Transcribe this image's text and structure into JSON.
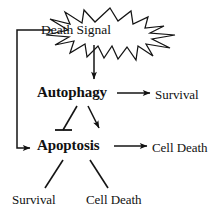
{
  "diagram": {
    "background_color": "#ffffff",
    "stroke_color": "#111111",
    "nodes": {
      "death_signal": {
        "label": "Death Signal",
        "shape": "starburst",
        "style": "plain"
      },
      "autophagy": {
        "label": "Autophagy",
        "shape": "text",
        "style": "bold"
      },
      "apoptosis": {
        "label": "Apoptosis",
        "shape": "text",
        "style": "bold"
      },
      "survival_from_autophagy": {
        "label": "Survival",
        "shape": "text",
        "style": "plain"
      },
      "cell_death_from_apoptosis": {
        "label": "Cell Death",
        "shape": "text",
        "style": "plain"
      },
      "survival_outcome": {
        "label": "Survival",
        "shape": "text",
        "style": "plain"
      },
      "cell_death_outcome": {
        "label": "Cell Death",
        "shape": "text",
        "style": "plain"
      }
    },
    "edges": [
      {
        "name": "death-signal-to-autophagy",
        "from": "death_signal",
        "to": "autophagy",
        "type": "activation",
        "head": "arrow",
        "orientation": "vertical-down"
      },
      {
        "name": "death-signal-to-apoptosis-feedback",
        "from": "death_signal",
        "to": "apoptosis",
        "type": "activation",
        "head": "arrow",
        "orientation": "bracket-left"
      },
      {
        "name": "autophagy-to-survival",
        "from": "autophagy",
        "to": "survival_from_autophagy",
        "type": "activation",
        "head": "arrow",
        "orientation": "horizontal-right"
      },
      {
        "name": "autophagy-inhibits-apoptosis",
        "from": "autophagy",
        "to": "apoptosis",
        "type": "inhibition",
        "head": "t-bar",
        "orientation": "diagonal-down-left"
      },
      {
        "name": "autophagy-activates-apoptosis",
        "from": "autophagy",
        "to": "apoptosis",
        "type": "activation",
        "head": "arrow",
        "orientation": "diagonal-down-right"
      },
      {
        "name": "apoptosis-to-cell-death",
        "from": "apoptosis",
        "to": "cell_death_from_apoptosis",
        "type": "activation",
        "head": "arrow",
        "orientation": "horizontal-right"
      },
      {
        "name": "apoptosis-to-survival-outcome",
        "from": "apoptosis",
        "to": "survival_outcome",
        "type": "plain",
        "head": "none",
        "orientation": "diagonal-down-left"
      },
      {
        "name": "apoptosis-to-cell-death-outcome",
        "from": "apoptosis",
        "to": "cell_death_outcome",
        "type": "plain",
        "head": "none",
        "orientation": "diagonal-down-right"
      }
    ]
  }
}
